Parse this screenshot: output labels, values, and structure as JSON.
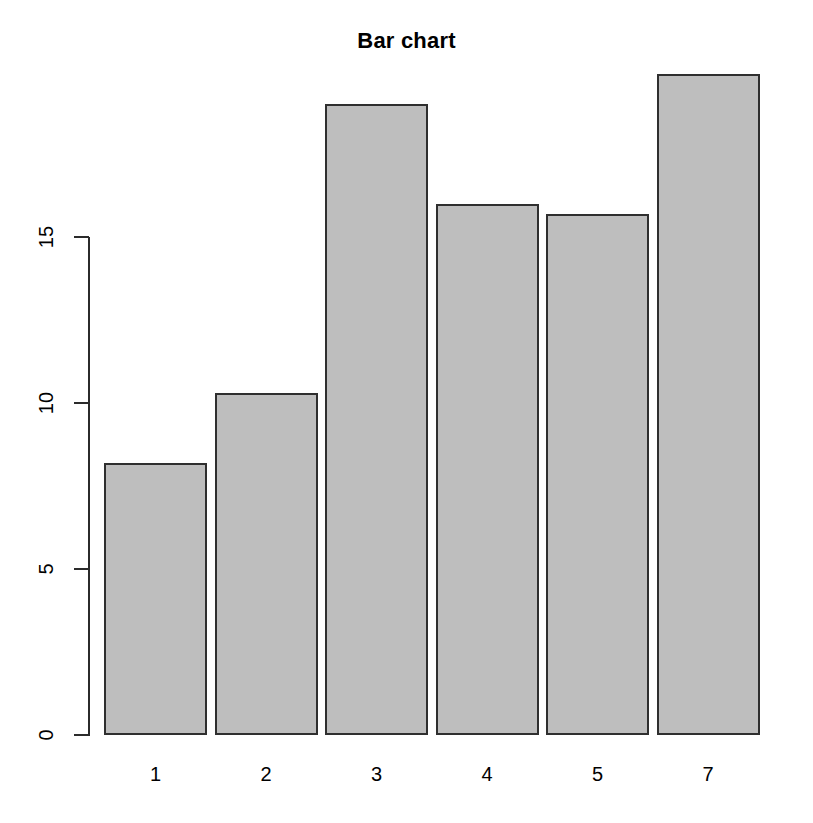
{
  "chart_data": {
    "type": "bar",
    "title": "Bar chart",
    "xlabel": "",
    "ylabel": "",
    "categories": [
      "1",
      "2",
      "3",
      "4",
      "5",
      "7"
    ],
    "values": [
      8.2,
      10.3,
      19.0,
      16.0,
      15.7,
      19.9
    ],
    "ylim": [
      0,
      20.6
    ],
    "y_ticks": [
      0,
      5,
      10,
      15
    ],
    "y_tick_labels": [
      "0",
      "5",
      "10",
      "15"
    ],
    "grid": false,
    "legend": null,
    "series": [
      {
        "name": "counts",
        "values": [
          8.2,
          10.3,
          19.0,
          16.0,
          15.7,
          19.9
        ]
      }
    ],
    "bar_fill_color": "#bebebe",
    "bar_border_color": "#2f2f2f",
    "axis_color": "#2b2b2b",
    "background_color": "#ffffff"
  },
  "geometry": {
    "plot_left": 104,
    "plot_right": 767,
    "baseline_y": 735,
    "top_value_y": 237,
    "axis_x": 88,
    "bar_width": 103,
    "bar_pitch": 110.5,
    "px_per_unit": 33.2
  }
}
